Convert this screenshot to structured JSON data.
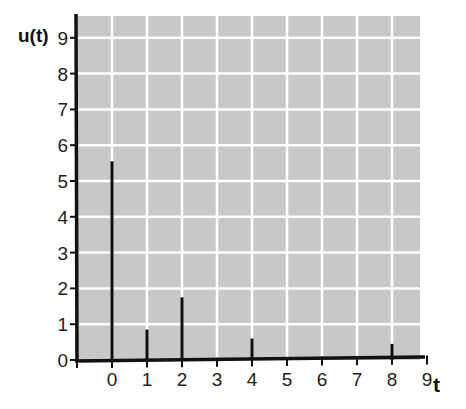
{
  "chart_data": {
    "type": "bar",
    "subtype": "stem",
    "title": "",
    "xlabel": "t",
    "ylabel": "u(t)",
    "x_ticks": [
      "0",
      "1",
      "2",
      "3",
      "4",
      "5",
      "6",
      "7",
      "8",
      "9"
    ],
    "y_ticks": [
      "0",
      "1",
      "2",
      "3",
      "4",
      "5",
      "6",
      "7",
      "8",
      "9"
    ],
    "xlim": [
      -1,
      9
    ],
    "ylim": [
      0,
      9.5
    ],
    "grid": true,
    "legend": null,
    "points": [
      {
        "t": 0,
        "u": 5.55
      },
      {
        "t": 1,
        "u": 0.85
      },
      {
        "t": 2,
        "u": 1.75
      },
      {
        "t": 4,
        "u": 0.6
      },
      {
        "t": 8,
        "u": 0.45
      }
    ]
  },
  "colors": {
    "plot_background": "#c8c8c8",
    "grid": "#ffffff",
    "axis": "#111111",
    "stem": "#111111"
  }
}
